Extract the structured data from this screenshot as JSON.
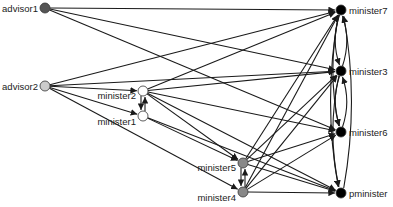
{
  "diagram": {
    "type": "directed-network",
    "nodes": [
      {
        "id": "advisor1",
        "label": "advisor1",
        "x": 45,
        "y": 8,
        "fill": "#555555",
        "label_side": "left"
      },
      {
        "id": "advisor2",
        "label": "advisor2",
        "x": 45,
        "y": 86,
        "fill": "#cccccc",
        "label_side": "left"
      },
      {
        "id": "minister2",
        "label": "minister2",
        "x": 143,
        "y": 91,
        "fill": "#ffffff",
        "label_side": "left"
      },
      {
        "id": "minister1",
        "label": "minister1",
        "x": 143,
        "y": 116,
        "fill": "#ffffff",
        "label_side": "left"
      },
      {
        "id": "minister5",
        "label": "minister5",
        "x": 243,
        "y": 163,
        "fill": "#888888",
        "label_side": "left"
      },
      {
        "id": "minister4",
        "label": "minister4",
        "x": 243,
        "y": 192,
        "fill": "#888888",
        "label_side": "left"
      },
      {
        "id": "minister7",
        "label": "minister7",
        "x": 341,
        "y": 10,
        "fill": "#000000",
        "label_side": "right"
      },
      {
        "id": "minister3",
        "label": "minister3",
        "x": 341,
        "y": 71,
        "fill": "#000000",
        "label_side": "right"
      },
      {
        "id": "minister6",
        "label": "minister6",
        "x": 341,
        "y": 132,
        "fill": "#000000",
        "label_side": "right"
      },
      {
        "id": "pminister",
        "label": "pminister",
        "x": 341,
        "y": 193,
        "fill": "#000000",
        "label_side": "right"
      }
    ],
    "edges": [
      [
        "advisor1",
        "minister7"
      ],
      [
        "advisor1",
        "minister3"
      ],
      [
        "advisor1",
        "minister6"
      ],
      [
        "advisor2",
        "minister2"
      ],
      [
        "advisor2",
        "minister1"
      ],
      [
        "advisor2",
        "minister4"
      ],
      [
        "advisor2",
        "minister3"
      ],
      [
        "advisor2",
        "minister7"
      ],
      [
        "minister2",
        "minister1"
      ],
      [
        "minister1",
        "minister2"
      ],
      [
        "minister2",
        "minister7"
      ],
      [
        "minister2",
        "minister3"
      ],
      [
        "minister2",
        "minister6"
      ],
      [
        "minister2",
        "minister5"
      ],
      [
        "minister2",
        "pminister"
      ],
      [
        "minister1",
        "minister5"
      ],
      [
        "minister1",
        "pminister"
      ],
      [
        "minister5",
        "minister4"
      ],
      [
        "minister4",
        "minister5"
      ],
      [
        "minister5",
        "minister7"
      ],
      [
        "minister5",
        "minister3"
      ],
      [
        "minister5",
        "minister6"
      ],
      [
        "minister5",
        "pminister"
      ],
      [
        "minister4",
        "minister7"
      ],
      [
        "minister4",
        "minister3"
      ],
      [
        "minister4",
        "minister6"
      ],
      [
        "minister4",
        "pminister"
      ],
      [
        "minister7",
        "minister3"
      ],
      [
        "minister3",
        "minister7"
      ],
      [
        "minister7",
        "minister6"
      ],
      [
        "minister3",
        "minister6"
      ],
      [
        "minister6",
        "minister3"
      ],
      [
        "minister7",
        "pminister"
      ],
      [
        "minister3",
        "pminister"
      ],
      [
        "pminister",
        "minister7"
      ]
    ]
  }
}
